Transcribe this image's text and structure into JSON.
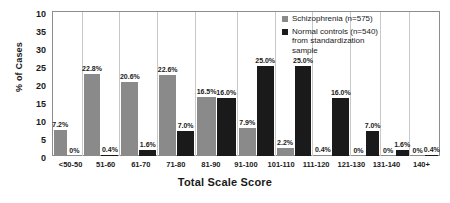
{
  "chart_data": {
    "type": "bar",
    "title": "",
    "xlabel": "Total Scale Score",
    "ylabel": "% of Cases",
    "categories": [
      "<50-50",
      "51-60",
      "61-70",
      "71-80",
      "81-90",
      "91-100",
      "101-110",
      "111-120",
      "121-130",
      "131-140",
      "140+"
    ],
    "series": [
      {
        "name": "Schizophrenia (n=575)",
        "color": "#8a8a8a",
        "values": [
          7.2,
          22.8,
          20.6,
          22.6,
          16.5,
          7.9,
          2.2,
          0.4,
          0,
          0,
          0
        ],
        "labels": [
          "7.2%",
          "22.8%",
          "20.6%",
          "22.6%",
          "16.5%",
          "7.9%",
          "2.2%",
          "0.4%",
          "0%",
          "0%",
          "0%"
        ]
      },
      {
        "name": "Normal controls (n=540) from standardization sample",
        "color": "#1a1a1a",
        "values": [
          0,
          0.4,
          1.6,
          7.0,
          16.0,
          25.0,
          25.0,
          16.0,
          7.0,
          1.6,
          0.4
        ],
        "labels": [
          "0%",
          "0.4%",
          "1.6%",
          "7.0%",
          "16.0%",
          "25.0%",
          "25.0%",
          "16.0%",
          "7.0%",
          "1.6%",
          "0.4%"
        ]
      }
    ],
    "ylim": [
      0,
      40
    ],
    "ytick_labels": [
      "10",
      "35",
      "30",
      "25",
      "20",
      "15",
      "10",
      "5",
      "0"
    ],
    "grid": false,
    "legend_position": "top-right"
  },
  "legend": {
    "entries": [
      {
        "label": "Schizophrenia (n=575)",
        "swatch": "gray-square-swatch"
      },
      {
        "label": "Normal controls (n=540)",
        "label2": "from standardization",
        "label3": "sample",
        "swatch": "black-square-swatch"
      }
    ]
  }
}
